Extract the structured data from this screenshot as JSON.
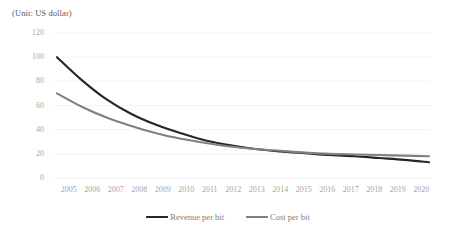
{
  "chart_data": {
    "type": "line",
    "title": "",
    "subtitle": "(Unit: US dollar)",
    "xlabel": "",
    "ylabel": "",
    "ylim": [
      0,
      120
    ],
    "yticks": [
      0,
      20,
      40,
      60,
      80,
      100,
      120
    ],
    "grid": true,
    "legend_position": "bottom",
    "categories": [
      "2005",
      "2006",
      "2007",
      "2008",
      "2009",
      "2010",
      "2011",
      "2012",
      "2013",
      "2014",
      "2015",
      "2016",
      "2017",
      "2018",
      "2019",
      "2020"
    ],
    "series": [
      {
        "name": "Revenue per bit",
        "color": "#262626",
        "values": [
          100,
          81,
          65,
          53,
          44,
          37,
          31,
          27,
          24,
          22,
          20.5,
          19,
          18,
          16.5,
          15,
          13
        ]
      },
      {
        "name": "Cost per bit",
        "color": "#808080",
        "values": [
          70,
          59,
          50,
          43,
          37,
          32.5,
          29,
          26,
          24,
          22.5,
          21,
          20,
          19.5,
          19,
          18.5,
          18
        ]
      }
    ]
  },
  "legend": {
    "items": [
      {
        "label": "Revenue per bit",
        "color": "#262626"
      },
      {
        "label": "Cost per bit",
        "color": "#808080"
      }
    ]
  },
  "axes": {
    "unit_note": "(Unit: US dollar)"
  },
  "colors": {
    "gridline": "#f2f2f2",
    "tick_text": "#a6a6a6",
    "legend_text": "#808080",
    "note_text": "#595959",
    "background": "#ffffff"
  }
}
